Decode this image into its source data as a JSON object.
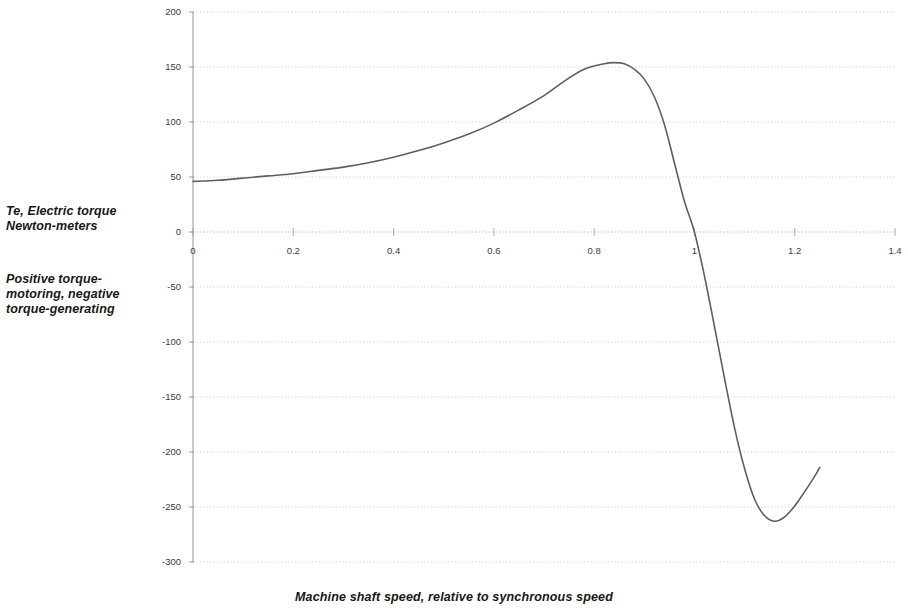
{
  "figure": {
    "background_color": "#ffffff",
    "axis_color": "#8c8c8c",
    "gridline_color": "#c9c9c9",
    "curve_color": "#5f5f5f",
    "text_color": "#171717"
  },
  "labels": {
    "y_axis_primary": "Te, Electric torque\nNewton-meters",
    "y_axis_note": "Positive torque-\nmotoring, negative\ntorque-generating",
    "x_axis_title": "Machine shaft speed,  relative to synchronous speed"
  },
  "chart_data": {
    "type": "line",
    "title": "",
    "subtitle": "",
    "xlabel": "Machine shaft speed,  relative to synchronous speed",
    "ylabel": "Te, Electric torque Newton-meters",
    "annotations": [
      "Te, Electric torque Newton-meters",
      "Positive torque-motoring, negative torque-generating"
    ],
    "legend": [],
    "legend_position": "none",
    "grid": true,
    "grid_axis": "y",
    "xlim": [
      0,
      1.4
    ],
    "ylim": [
      -300,
      200
    ],
    "xticks": [
      0,
      0.2,
      0.4,
      0.6,
      0.8,
      1,
      1.2,
      1.4
    ],
    "xticklabels": [
      "0",
      "0.2",
      "0.4",
      "0.6",
      "0.8",
      "1",
      "1.2",
      "1.4"
    ],
    "yticks": [
      200,
      150,
      100,
      50,
      0,
      -50,
      -100,
      -150,
      -200,
      -250,
      -300
    ],
    "yticklabels": [
      "200",
      "150",
      "100",
      "50",
      "0",
      "-50",
      "-100",
      "-150",
      "-200",
      "-250",
      "-300"
    ],
    "series": [
      {
        "name": "Te",
        "color": "#5f5f5f",
        "x": [
          0.0,
          0.05,
          0.1,
          0.15,
          0.2,
          0.25,
          0.3,
          0.35,
          0.4,
          0.45,
          0.5,
          0.55,
          0.6,
          0.65,
          0.7,
          0.74,
          0.78,
          0.82,
          0.84,
          0.86,
          0.88,
          0.9,
          0.92,
          0.94,
          0.96,
          0.98,
          1.0,
          1.02,
          1.04,
          1.06,
          1.08,
          1.1,
          1.12,
          1.14,
          1.16,
          1.18,
          1.2,
          1.22,
          1.24,
          1.25
        ],
        "y": [
          46,
          47,
          49,
          51,
          53,
          56,
          59,
          63,
          68,
          74,
          81,
          89,
          99,
          111,
          124,
          137,
          148,
          153,
          154,
          153,
          148,
          139,
          123,
          98,
          63,
          28,
          0,
          -40,
          -86,
          -133,
          -178,
          -215,
          -243,
          -258,
          -263,
          -259,
          -249,
          -236,
          -222,
          -214
        ],
        "marker": "none",
        "linewidth": 1.6
      }
    ],
    "key_points": {
      "start": {
        "x": 0.0,
        "y": 46,
        "note": "locked-rotor / starting torque"
      },
      "breakdown_max": {
        "x": 0.85,
        "y": 154,
        "note": "peak motoring torque"
      },
      "synchronous": {
        "x": 1.0,
        "y": 0,
        "note": "zero torque at synchronous speed"
      },
      "breakdown_min": {
        "x": 1.16,
        "y": -263,
        "note": "peak generating torque"
      },
      "end": {
        "x": 1.25,
        "y": -214,
        "note": "curve end"
      }
    }
  }
}
